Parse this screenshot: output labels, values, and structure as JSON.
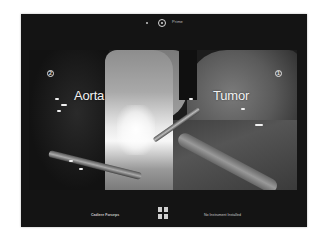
{
  "topbar": {
    "camera_icon": "camera-icon",
    "label": "Prime"
  },
  "video": {
    "labels": {
      "left": "Aorta",
      "right": "Tumor"
    },
    "markers": {
      "left": "2",
      "right": "1"
    }
  },
  "bottombar": {
    "left_instrument": "Cadiere Forceps",
    "center_icon": "grid-icon",
    "right_instrument": "No Instrument Installed"
  },
  "colors": {
    "panel_bg": "#141414",
    "text": "#f2f2f2",
    "page_bg": "#ffffff"
  }
}
